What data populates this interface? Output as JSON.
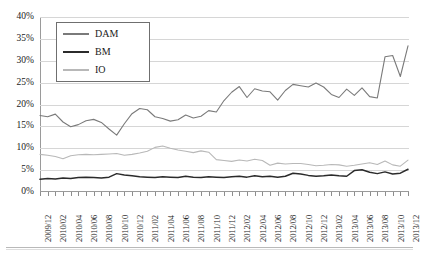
{
  "chart_data": {
    "type": "line",
    "title": "",
    "xlabel": "",
    "ylabel": "",
    "ylim": [
      0,
      40
    ],
    "ytick_labels": [
      "0%",
      "5%",
      "10%",
      "15%",
      "20%",
      "25%",
      "30%",
      "35%",
      "40%"
    ],
    "ytick_values": [
      0,
      5,
      10,
      15,
      20,
      25,
      30,
      35,
      40
    ],
    "grid": true,
    "legend_position": "top-left",
    "x_tick_labels": [
      "2009/12",
      "2010/02",
      "2010/04",
      "2010/06",
      "2010/08",
      "2010/10",
      "2010/12",
      "2011/02",
      "2011/04",
      "2011/06",
      "2011/08",
      "2011/10",
      "2011/12",
      "2012/02",
      "2012/04",
      "2012/06",
      "2012/08",
      "2012/10",
      "2012/12",
      "2013/02",
      "2013/04",
      "2013/06",
      "2013/08",
      "2013/10",
      "2013/12"
    ],
    "x": [
      "2009/12",
      "2010/01",
      "2010/02",
      "2010/03",
      "2010/04",
      "2010/05",
      "2010/06",
      "2010/07",
      "2010/08",
      "2010/09",
      "2010/10",
      "2010/11",
      "2010/12",
      "2011/01",
      "2011/02",
      "2011/03",
      "2011/04",
      "2011/05",
      "2011/06",
      "2011/07",
      "2011/08",
      "2011/09",
      "2011/10",
      "2011/11",
      "2011/12",
      "2012/01",
      "2012/02",
      "2012/03",
      "2012/04",
      "2012/05",
      "2012/06",
      "2012/07",
      "2012/08",
      "2012/09",
      "2012/10",
      "2012/11",
      "2012/12",
      "2013/01",
      "2013/02",
      "2013/03",
      "2013/04",
      "2013/05",
      "2013/06",
      "2013/07",
      "2013/08",
      "2013/09",
      "2013/10",
      "2013/11",
      "2013/12"
    ],
    "series": [
      {
        "name": "DAM",
        "color": "#7a7a7a",
        "values": [
          17.5,
          17.2,
          17.8,
          16.0,
          14.9,
          15.4,
          16.3,
          16.6,
          15.9,
          14.4,
          13.0,
          15.6,
          17.9,
          19.1,
          18.8,
          17.2,
          16.8,
          16.2,
          16.5,
          17.6,
          16.9,
          17.3,
          18.6,
          18.3,
          20.9,
          22.8,
          24.1,
          21.6,
          23.6,
          23.1,
          22.9,
          21.0,
          23.2,
          24.6,
          24.3,
          24.0,
          24.9,
          24.0,
          22.3,
          21.6,
          23.5,
          22.1,
          23.8,
          21.8,
          21.5,
          30.9,
          31.2,
          26.4,
          33.4
        ]
      },
      {
        "name": "BM",
        "color": "#2b2b2b",
        "values": [
          2.9,
          3.1,
          3.0,
          3.2,
          3.1,
          3.3,
          3.4,
          3.3,
          3.2,
          3.4,
          4.2,
          3.9,
          3.7,
          3.5,
          3.4,
          3.3,
          3.5,
          3.4,
          3.3,
          3.6,
          3.4,
          3.3,
          3.5,
          3.4,
          3.3,
          3.5,
          3.6,
          3.4,
          3.7,
          3.5,
          3.6,
          3.4,
          3.6,
          4.3,
          4.1,
          3.8,
          3.6,
          3.7,
          3.9,
          3.7,
          3.6,
          4.9,
          5.1,
          4.5,
          4.2,
          4.6,
          4.1,
          4.3,
          5.2
        ]
      },
      {
        "name": "IO",
        "color": "#b8b8b8",
        "values": [
          8.6,
          8.4,
          8.1,
          7.6,
          8.3,
          8.5,
          8.6,
          8.5,
          8.6,
          8.7,
          8.8,
          8.4,
          8.6,
          8.9,
          9.3,
          10.2,
          10.5,
          10.0,
          9.6,
          9.3,
          9.0,
          9.4,
          9.1,
          7.4,
          7.2,
          7.0,
          7.3,
          7.1,
          7.5,
          7.2,
          6.1,
          6.6,
          6.4,
          6.5,
          6.5,
          6.3,
          6.0,
          6.1,
          6.3,
          6.2,
          5.9,
          6.1,
          6.4,
          6.7,
          6.3,
          7.1,
          6.2,
          5.9,
          7.3
        ]
      }
    ]
  },
  "legend": {
    "items": [
      {
        "label": "DAM"
      },
      {
        "label": "BM"
      },
      {
        "label": "IO"
      }
    ]
  }
}
